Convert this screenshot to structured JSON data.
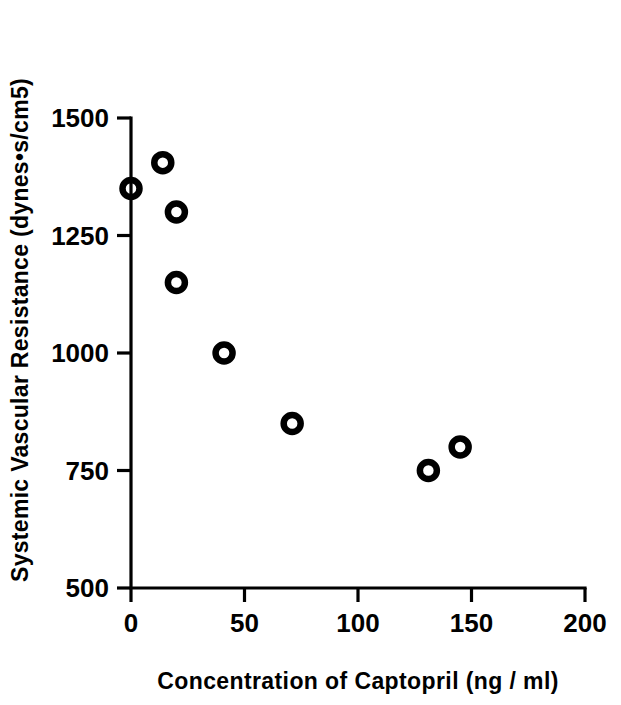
{
  "chart_data": {
    "type": "scatter",
    "title": "",
    "xlabel": "Concentration of Captopril (ng / ml)",
    "ylabel": "Systemic Vascular Resistance (dynes•s/cm5)",
    "xlim": [
      0,
      200
    ],
    "ylim": [
      500,
      1500
    ],
    "xticks": [
      0,
      50,
      100,
      150,
      200
    ],
    "yticks": [
      500,
      750,
      1000,
      1250,
      1500
    ],
    "xtick_labels": [
      "0",
      "50",
      "100",
      "150",
      "200"
    ],
    "ytick_labels": [
      "500",
      "750",
      "1000",
      "1250",
      "1500"
    ],
    "grid": false,
    "legend": null,
    "marker": "open-circle",
    "marker_color": "#000000",
    "series": [
      {
        "name": "Systemic Vascular Resistance vs Captopril",
        "points": [
          {
            "x": 0,
            "y": 1350
          },
          {
            "x": 14,
            "y": 1405
          },
          {
            "x": 20,
            "y": 1300
          },
          {
            "x": 20,
            "y": 1150
          },
          {
            "x": 41,
            "y": 1000
          },
          {
            "x": 71,
            "y": 850
          },
          {
            "x": 131,
            "y": 750
          },
          {
            "x": 145,
            "y": 800
          }
        ]
      }
    ]
  },
  "axes": {
    "x_title": "Concentration of Captopril (ng / ml)",
    "y_title": "Systemic Vascular Resistance (dynes•s/cm5)"
  }
}
